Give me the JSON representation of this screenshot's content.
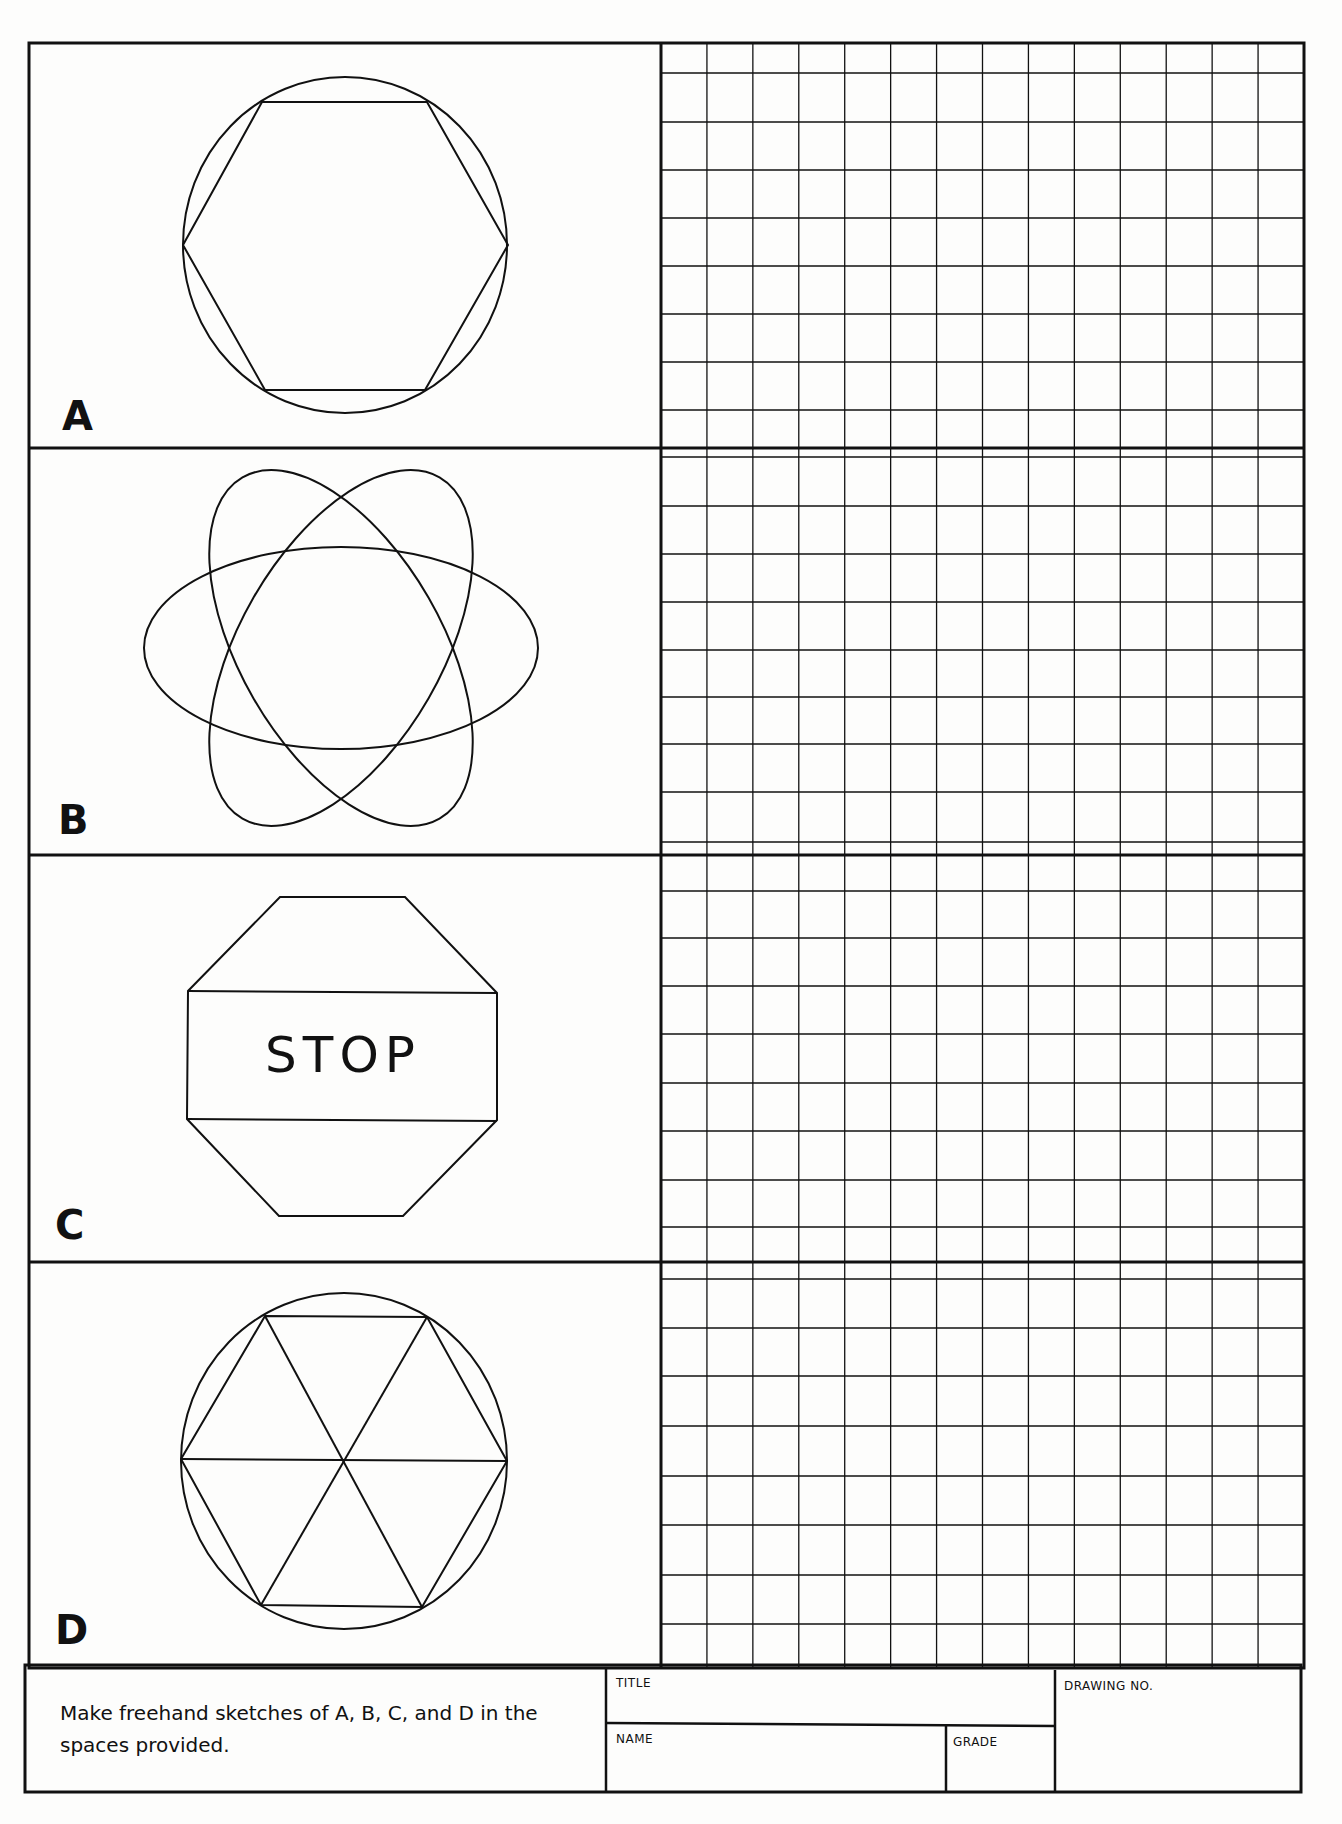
{
  "sheet": {
    "background": "#fdfdfc",
    "ink": "#111111",
    "border": {
      "left": 29,
      "top": 43,
      "right": 1304,
      "bottom": 1793
    },
    "divider_x": 661,
    "grid_right": 1304
  },
  "panels": [
    {
      "id": "A",
      "label": "A",
      "top": 43,
      "bottom": 448,
      "label_pos": {
        "x": 62,
        "y": 396
      },
      "shape": "circle-hexagon",
      "description": "Circle with inscribed hexagon",
      "grid_rows": [
        73,
        122,
        170,
        218,
        266,
        314,
        362,
        410
      ]
    },
    {
      "id": "B",
      "label": "B",
      "label_pos": {
        "x": 58,
        "y": 800
      },
      "top": 448,
      "bottom": 855,
      "shape": "three-ellipses",
      "description": "Three intersecting ellipses (atom)",
      "grid_rows": [
        457,
        506,
        554,
        602,
        650,
        697,
        744,
        792,
        842
      ]
    },
    {
      "id": "C",
      "label": "C",
      "label_pos": {
        "x": 55,
        "y": 1204
      },
      "top": 855,
      "bottom": 1262,
      "shape": "stop-sign",
      "description": "Octagon stop sign",
      "text": "STOP",
      "grid_rows": [
        891,
        938,
        986,
        1034,
        1083,
        1131,
        1180,
        1227
      ]
    },
    {
      "id": "D",
      "label": "D",
      "label_pos": {
        "x": 55,
        "y": 1610
      },
      "top": 1262,
      "bottom": 1668,
      "shape": "circle-hexagon-spokes",
      "description": "Circle with inscribed hexagon divided into six triangles",
      "grid_rows": [
        1279,
        1328,
        1376,
        1426,
        1476,
        1525,
        1575,
        1624
      ]
    }
  ],
  "grid": {
    "columns": 14,
    "column_width": 46.0
  },
  "title_block": {
    "top": 1667,
    "bottom": 1793,
    "instructions": "Make freehand sketches of A, B, C, and D in the spaces provided.",
    "title_label": "TITLE",
    "name_label": "NAME",
    "grade_label": "GRADE",
    "drawing_no_label": "DRAWING NO.",
    "title_value": "",
    "name_value": "",
    "grade_value": "",
    "drawing_no_value": ""
  }
}
